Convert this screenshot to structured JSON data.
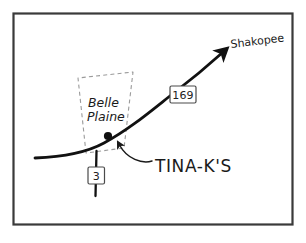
{
  "figure": {
    "kind": "hand-drawn-location-map",
    "frame": {
      "border_color": "#3a3a3a",
      "background_color": "#ffffff",
      "x": 13,
      "y": 13,
      "width": 280,
      "height": 212
    }
  },
  "labels": {
    "destination": "Shakopee",
    "city_area": "Belle Plaine",
    "city_area_line1": "Belle",
    "city_area_line2": "Plaine",
    "poi": "TINA-K'S"
  },
  "shields": [
    {
      "name": "highway-shield-169",
      "number": "169",
      "x": 170,
      "y": 86,
      "width": 26,
      "height": 17
    },
    {
      "name": "highway-shield-3",
      "number": "3",
      "x": 87,
      "y": 168,
      "width": 17,
      "height": 17
    }
  ],
  "colors": {
    "ink": "#1a1a1a",
    "road": "#111111",
    "dashed_boundary": "#8c8c8c",
    "shield_outline": "#4a4a4a",
    "frame": "#3a3a3a",
    "paper": "#ffffff"
  },
  "markers": [
    {
      "name": "poi-dot",
      "label": "TINA-K'S",
      "x": 108,
      "y": 136,
      "radius": 4
    }
  ],
  "geometry": {
    "main_road_path": "M 35 158 C 60 157, 84 154, 104 143 C 130 129, 152 110, 175 92 C 196 76, 212 62, 224 52",
    "arrow_tip": {
      "x": 226,
      "y": 50
    },
    "cross_road_path": "M 96 152 L 96 196",
    "boundary_polygon": "86,153 78,78 133,72 124,148",
    "pointer_path": "M 152 161 C 141 163, 126 158, 119 145"
  }
}
